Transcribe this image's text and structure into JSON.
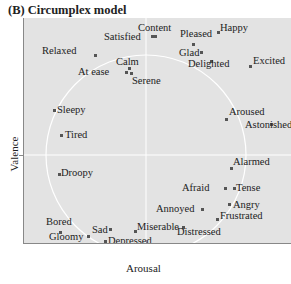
{
  "title": "(B) Circumplex model",
  "axes": {
    "x_label": "Arousal",
    "y_label": "Valence"
  },
  "colors": {
    "plot_bg": "#e3e3e3",
    "circle": "#ffffff",
    "axis": "#888888",
    "text": "#222222"
  },
  "emotions": [
    {
      "label": "Content",
      "lx": 114,
      "ly": 4,
      "dx": 130,
      "dy": 17
    },
    {
      "label": "Satisfied",
      "lx": 80,
      "ly": 13,
      "dx": 127,
      "dy": 17
    },
    {
      "label": "Relaxed",
      "lx": 18,
      "ly": 27,
      "dx": 70,
      "dy": 36
    },
    {
      "label": "Calm",
      "lx": 92,
      "ly": 38,
      "dx": 104,
      "dy": 49
    },
    {
      "label": "At ease",
      "lx": 54,
      "ly": 48,
      "dx": 101,
      "dy": 53
    },
    {
      "label": "Serene",
      "lx": 108,
      "ly": 57,
      "dx": 106,
      "dy": 54
    },
    {
      "label": "Pleased",
      "lx": 156,
      "ly": 10,
      "dx": 168,
      "dy": 25
    },
    {
      "label": "Happy",
      "lx": 196,
      "ly": 4,
      "dx": 193,
      "dy": 13
    },
    {
      "label": "Glad",
      "lx": 155,
      "ly": 29,
      "dx": 176,
      "dy": 33
    },
    {
      "label": "Delighted",
      "lx": 164,
      "ly": 40,
      "dx": 186,
      "dy": 42
    },
    {
      "label": "Excited",
      "lx": 229,
      "ly": 37,
      "dx": 225,
      "dy": 47
    },
    {
      "label": "Sleepy",
      "lx": 33,
      "ly": 86,
      "dx": 29,
      "dy": 91
    },
    {
      "label": "Tired",
      "lx": 41,
      "ly": 111,
      "dx": 36,
      "dy": 116
    },
    {
      "label": "Aroused",
      "lx": 205,
      "ly": 88,
      "dx": 201,
      "dy": 100
    },
    {
      "label": "Astonished",
      "lx": 221,
      "ly": 101,
      "dx": 246,
      "dy": 105
    },
    {
      "label": "Alarmed",
      "lx": 209,
      "ly": 138,
      "dx": 206,
      "dy": 149
    },
    {
      "label": "Droopy",
      "lx": 37,
      "ly": 149,
      "dx": 34,
      "dy": 155
    },
    {
      "label": "Afraid",
      "lx": 158,
      "ly": 164,
      "dx": 200,
      "dy": 169
    },
    {
      "label": "Tense",
      "lx": 212,
      "ly": 164,
      "dx": 209,
      "dy": 169
    },
    {
      "label": "Annoyed",
      "lx": 132,
      "ly": 185,
      "dx": 177,
      "dy": 190
    },
    {
      "label": "Angry",
      "lx": 209,
      "ly": 181,
      "dx": 204,
      "dy": 185
    },
    {
      "label": "Frustrated",
      "lx": 196,
      "ly": 192,
      "dx": 192,
      "dy": 200
    },
    {
      "label": "Bored",
      "lx": 22,
      "ly": 198,
      "dx": 35,
      "dy": 213
    },
    {
      "label": "Sad",
      "lx": 68,
      "ly": 206,
      "dx": 85,
      "dy": 210
    },
    {
      "label": "Gloomy",
      "lx": 25,
      "ly": 213,
      "dx": 63,
      "dy": 217
    },
    {
      "label": "Depressed",
      "lx": 84,
      "ly": 217,
      "dx": 80,
      "dy": 222
    },
    {
      "label": "Miserable",
      "lx": 113,
      "ly": 203,
      "dx": 110,
      "dy": 212
    },
    {
      "label": "Distressed",
      "lx": 153,
      "ly": 208,
      "dx": 158,
      "dy": 208
    }
  ]
}
